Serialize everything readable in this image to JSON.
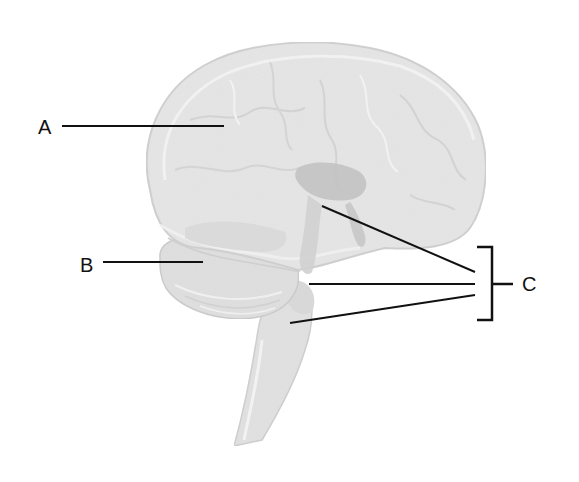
{
  "diagram": {
    "labels": [
      {
        "id": "A",
        "text": "A",
        "points_to": "cerebrum"
      },
      {
        "id": "B",
        "text": "B",
        "points_to": "cerebellum"
      },
      {
        "id": "C",
        "text": "C",
        "points_to": "brain stem (midbrain, pons, medulla)"
      }
    ],
    "colors": {
      "background": "#ffffff",
      "brain_fill": "#e6e6e6",
      "brain_shadow": "#c9c9c9",
      "brain_highlight": "#f4f4f4",
      "inner_structure": "#bdbdbd",
      "line": "#111111"
    }
  }
}
